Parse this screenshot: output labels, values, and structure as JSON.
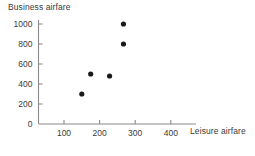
{
  "chart_data": {
    "type": "scatter",
    "title": "",
    "xlabel": "Leisure airfare",
    "ylabel": "Business airfare",
    "xlim": [
      0,
      460
    ],
    "ylim": [
      0,
      1060
    ],
    "xticks": [
      100,
      200,
      300,
      400
    ],
    "yticks": [
      0,
      200,
      400,
      600,
      800,
      1000
    ],
    "xtick_labels": [
      "100",
      "200",
      "300",
      "400"
    ],
    "ytick_labels": [
      "0",
      "200",
      "400",
      "600",
      "800",
      "1000"
    ],
    "grid": false,
    "legend": false,
    "marker": "filled-circle",
    "marker_color": "#1a1a1a",
    "axis_color": "#8a8a8a",
    "points": [
      {
        "x": 150,
        "y": 300
      },
      {
        "x": 175,
        "y": 500
      },
      {
        "x": 228,
        "y": 480
      },
      {
        "x": 267,
        "y": 1000
      },
      {
        "x": 267,
        "y": 800
      }
    ],
    "series": [
      {
        "name": "airfare",
        "x": [
          150,
          175,
          228,
          267,
          267
        ],
        "values": [
          300,
          500,
          480,
          1000,
          800
        ]
      }
    ]
  }
}
